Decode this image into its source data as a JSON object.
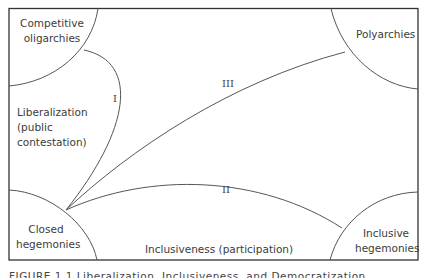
{
  "diagram": {
    "regions": {
      "top_left": [
        "Competitive",
        "oligarchies"
      ],
      "top_right": "Polyarchies",
      "bottom_left": [
        "Closed",
        "hegemonies"
      ],
      "bottom_right": [
        "Inclusive",
        "hegemonies"
      ]
    },
    "axes": {
      "y_axis_label": [
        "Liberalization",
        "(public",
        "contestation)"
      ],
      "x_axis_label": "Inclusiveness (participation)"
    },
    "paths": [
      {
        "id": "I",
        "label": "I",
        "from": "Closed hegemonies",
        "to": "Competitive oligarchies"
      },
      {
        "id": "II",
        "label": "II",
        "from": "Closed hegemonies",
        "to": "Inclusive hegemonies"
      },
      {
        "id": "III",
        "label": "III",
        "from": "Closed hegemonies",
        "to": "Polyarchies"
      }
    ],
    "caption": "FIGURE 1.1 Liberalization, Inclusiveness, and Democratization",
    "line_color": "#555555",
    "frame_color": "#333333"
  }
}
